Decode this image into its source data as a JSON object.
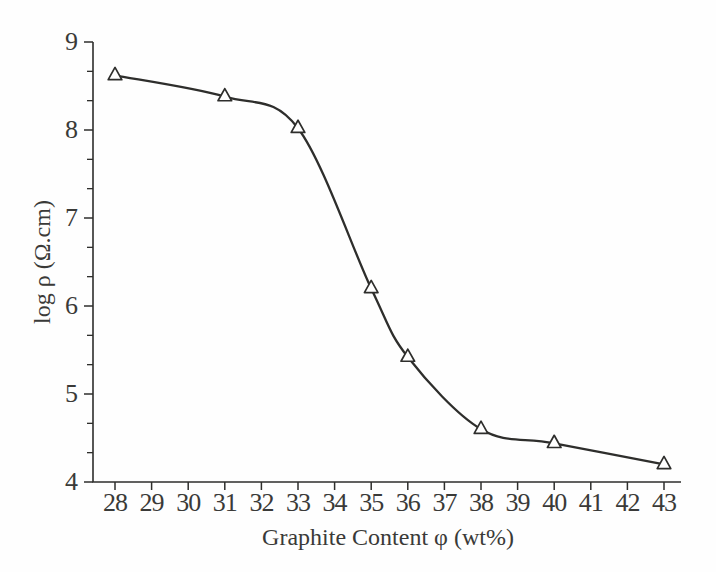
{
  "figure": {
    "background": "#fefefe",
    "line_color": "#2e2e2c",
    "text_color": "#3a3a38",
    "marker_fill": "#ffffff"
  },
  "chart_data": {
    "type": "line",
    "title": "",
    "xlabel": "Graphite Content φ (wt%)",
    "ylabel": "log ρ (Ω.cm)",
    "x": [
      28,
      31,
      33,
      35,
      36,
      38,
      40,
      43
    ],
    "y": [
      8.62,
      8.38,
      8.02,
      6.2,
      5.42,
      4.6,
      4.44,
      4.2
    ],
    "xlim": [
      28,
      43
    ],
    "ylim": [
      4,
      9
    ],
    "x_ticks": [
      28,
      29,
      30,
      31,
      32,
      33,
      34,
      35,
      36,
      37,
      38,
      39,
      40,
      41,
      42,
      43
    ],
    "y_ticks": [
      4,
      5,
      6,
      7,
      8,
      9
    ],
    "y_minor_divisions": 3,
    "marker": "open-triangle",
    "grid": false,
    "legend": false
  }
}
